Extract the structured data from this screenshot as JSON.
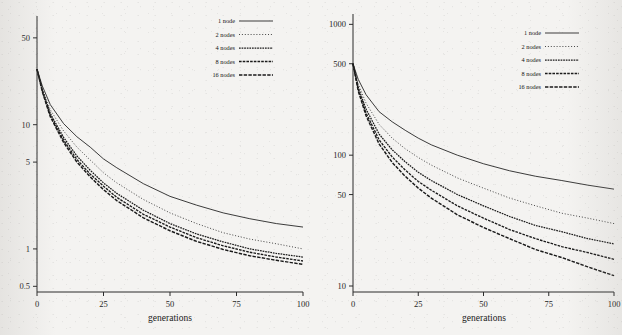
{
  "figure": {
    "background_color": "#f4f3f1",
    "ink_color": "#1a1a1a"
  },
  "panels": [
    {
      "name": "left-panel",
      "x_axis": {
        "label": "generations",
        "ticks": [
          "0",
          "25",
          "50",
          "75",
          "100"
        ],
        "values": [
          0,
          25,
          50,
          75,
          100
        ],
        "range": [
          0,
          100
        ],
        "scale": "linear"
      },
      "y_axis": {
        "label": "",
        "ticks": [
          "50",
          "10",
          "5",
          "1",
          "0.5"
        ],
        "values": [
          50,
          10,
          5,
          1,
          0.5
        ],
        "range": [
          0.45,
          75
        ],
        "scale": "log"
      },
      "legend": {
        "position": "top-right",
        "entries": [
          {
            "label": "1 node",
            "style": "solid"
          },
          {
            "label": "2 nodes",
            "style": "dotted"
          },
          {
            "label": "4 nodes",
            "style": "dash-fine"
          },
          {
            "label": "8 nodes",
            "style": "dash-medium"
          },
          {
            "label": "16 nodes",
            "style": "dash-coarse"
          }
        ]
      }
    },
    {
      "name": "right-panel",
      "x_axis": {
        "label": "generations",
        "ticks": [
          "0",
          "25",
          "50",
          "75",
          "100"
        ],
        "values": [
          0,
          25,
          50,
          75,
          100
        ],
        "range": [
          0,
          100
        ],
        "scale": "linear"
      },
      "y_axis": {
        "label": "",
        "ticks": [
          "1000",
          "500",
          "100",
          "50",
          "10"
        ],
        "values": [
          1000,
          500,
          100,
          50,
          10
        ],
        "range": [
          9,
          1200
        ],
        "scale": "log"
      },
      "legend": {
        "position": "top-right",
        "entries": [
          {
            "label": "1 node",
            "style": "solid"
          },
          {
            "label": "2 nodes",
            "style": "dotted"
          },
          {
            "label": "4 nodes",
            "style": "dash-fine"
          },
          {
            "label": "8 nodes",
            "style": "dash-medium"
          },
          {
            "label": "16 nodes",
            "style": "dash-coarse"
          }
        ]
      }
    }
  ],
  "chart_data": [
    {
      "type": "line",
      "name": "left-panel",
      "title": "",
      "xlabel": "generations",
      "ylabel": "",
      "xlim": [
        0,
        100
      ],
      "ylim": [
        0.45,
        75
      ],
      "yscale": "log",
      "xscale": "linear",
      "grid": false,
      "legend_position": "top-right",
      "xticks": [
        0,
        25,
        50,
        75,
        100
      ],
      "yticks": [
        50,
        10,
        5,
        1,
        0.5
      ],
      "x": [
        0,
        2,
        5,
        10,
        15,
        20,
        25,
        30,
        40,
        50,
        60,
        70,
        80,
        90,
        100
      ],
      "series": [
        {
          "name": "1 node",
          "style": "solid",
          "values": [
            28,
            20.5,
            14.5,
            10.2,
            8.0,
            6.6,
            5.3,
            4.5,
            3.35,
            2.65,
            2.25,
            1.95,
            1.75,
            1.6,
            1.5
          ]
        },
        {
          "name": "2 nodes",
          "style": "dotted",
          "values": [
            28,
            19.5,
            13.2,
            8.9,
            6.6,
            5.2,
            4.1,
            3.4,
            2.5,
            1.95,
            1.6,
            1.35,
            1.2,
            1.1,
            1.0
          ]
        },
        {
          "name": "4 nodes",
          "style": "dash-fine",
          "values": [
            28,
            19.0,
            12.3,
            7.9,
            5.6,
            4.3,
            3.4,
            2.8,
            2.05,
            1.6,
            1.32,
            1.14,
            1.0,
            0.92,
            0.86
          ]
        },
        {
          "name": "8 nodes",
          "style": "dash-medium",
          "values": [
            28,
            18.7,
            11.9,
            7.5,
            5.25,
            4.0,
            3.2,
            2.6,
            1.9,
            1.5,
            1.23,
            1.06,
            0.94,
            0.86,
            0.8
          ]
        },
        {
          "name": "16 nodes",
          "style": "dash-coarse",
          "values": [
            28,
            18.4,
            11.6,
            7.2,
            5.0,
            3.8,
            3.0,
            2.45,
            1.78,
            1.4,
            1.15,
            0.99,
            0.88,
            0.81,
            0.75
          ]
        }
      ]
    },
    {
      "type": "line",
      "name": "right-panel",
      "title": "",
      "xlabel": "generations",
      "ylabel": "",
      "xlim": [
        0,
        100
      ],
      "ylim": [
        9,
        1200
      ],
      "yscale": "log",
      "xscale": "linear",
      "grid": false,
      "legend_position": "top-right",
      "xticks": [
        0,
        25,
        50,
        75,
        100
      ],
      "yticks": [
        1000,
        500,
        100,
        50,
        10
      ],
      "x": [
        0,
        2,
        5,
        10,
        15,
        20,
        25,
        30,
        40,
        50,
        60,
        70,
        80,
        90,
        100
      ],
      "series": [
        {
          "name": "1 node",
          "style": "solid",
          "values": [
            500,
            380,
            290,
            215,
            180,
            155,
            135,
            120,
            100,
            86,
            76,
            69,
            64,
            59,
            55
          ]
        },
        {
          "name": "2 nodes",
          "style": "dotted",
          "values": [
            500,
            350,
            250,
            172,
            135,
            112,
            96,
            84,
            67,
            56,
            47,
            41,
            36,
            33,
            30
          ]
        },
        {
          "name": "4 nodes",
          "style": "dash-fine",
          "values": [
            500,
            330,
            225,
            145,
            110,
            89,
            74,
            64,
            50,
            41,
            34,
            29,
            26,
            23,
            21
          ]
        },
        {
          "name": "8 nodes",
          "style": "dash-medium",
          "values": [
            500,
            320,
            210,
            131,
            97,
            77,
            63,
            54,
            41,
            33,
            27,
            23,
            20,
            18,
            16
          ]
        },
        {
          "name": "16 nodes",
          "style": "dash-coarse",
          "values": [
            500,
            310,
            200,
            122,
            88,
            69,
            56,
            47,
            35,
            28,
            23,
            19,
            16.5,
            14,
            12
          ]
        }
      ]
    }
  ]
}
